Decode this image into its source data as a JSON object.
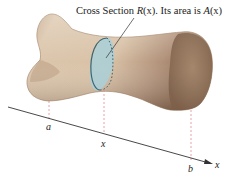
{
  "figure": {
    "caption_parts": {
      "prefix": "Cross Section ",
      "r_symbol": "R",
      "r_arg": "(x)",
      "middle": ". Its area is ",
      "a_symbol": "A",
      "a_arg": "(x)"
    },
    "axis": {
      "label": "x",
      "points": [
        {
          "id": "a",
          "label": "a"
        },
        {
          "id": "x",
          "label": "x"
        },
        {
          "id": "b",
          "label": "b"
        }
      ]
    },
    "colors": {
      "bone_light": "#e2cdb4",
      "bone_mid": "#c7ab8e",
      "bone_dark": "#8d6f55",
      "cross_section_fill": "#a9d0d8",
      "cross_section_edge": "#3c6674",
      "guide_dash": "#e58c96",
      "axis": "#333333"
    }
  }
}
